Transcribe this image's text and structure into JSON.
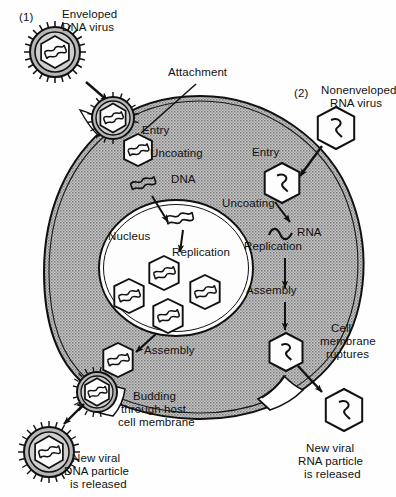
{
  "figure": {
    "colors": {
      "ink": "#111111",
      "cytoplasm": "#b4b4b4",
      "nucleoplasm": "#ffffff",
      "virus_envelope_fill": "#b0b0b0",
      "background": "#ffffff"
    }
  },
  "pathways": {
    "one": {
      "marker": "(1)",
      "title_line1": "Enveloped",
      "title_line2": "DNA virus",
      "steps": {
        "attachment": "Attachment",
        "entry": "Entry",
        "uncoating": "Uncoating",
        "genome": "DNA",
        "replication": "Replication",
        "assembly": "Assembly",
        "budding_line1": "Budding",
        "budding_line2": "through host",
        "budding_line3": "cell membrane",
        "released_line1": "New viral",
        "released_line2": "DNA particle",
        "released_line3": "is released"
      }
    },
    "two": {
      "marker": "(2)",
      "title_line1": "Nonenveloped",
      "title_line2": "RNA virus",
      "steps": {
        "entry": "Entry",
        "uncoating": "Uncoating",
        "genome": "RNA",
        "replication": "Replication",
        "assembly": "Assembly",
        "rupture_line1": "Cell",
        "rupture_line2": "membrane",
        "rupture_line3": "ruptures",
        "released_line1": "New viral",
        "released_line2": "RNA particle",
        "released_line3": "is released"
      }
    }
  },
  "cell": {
    "nucleus_label": "Nucleus"
  },
  "icons": {
    "enveloped_virion": "enveloped-virion-icon",
    "naked_capsid": "naked-capsid-icon",
    "dna_strand": "dna-strand-icon",
    "rna_strand": "rna-strand-icon",
    "arrow": "arrow-icon"
  }
}
